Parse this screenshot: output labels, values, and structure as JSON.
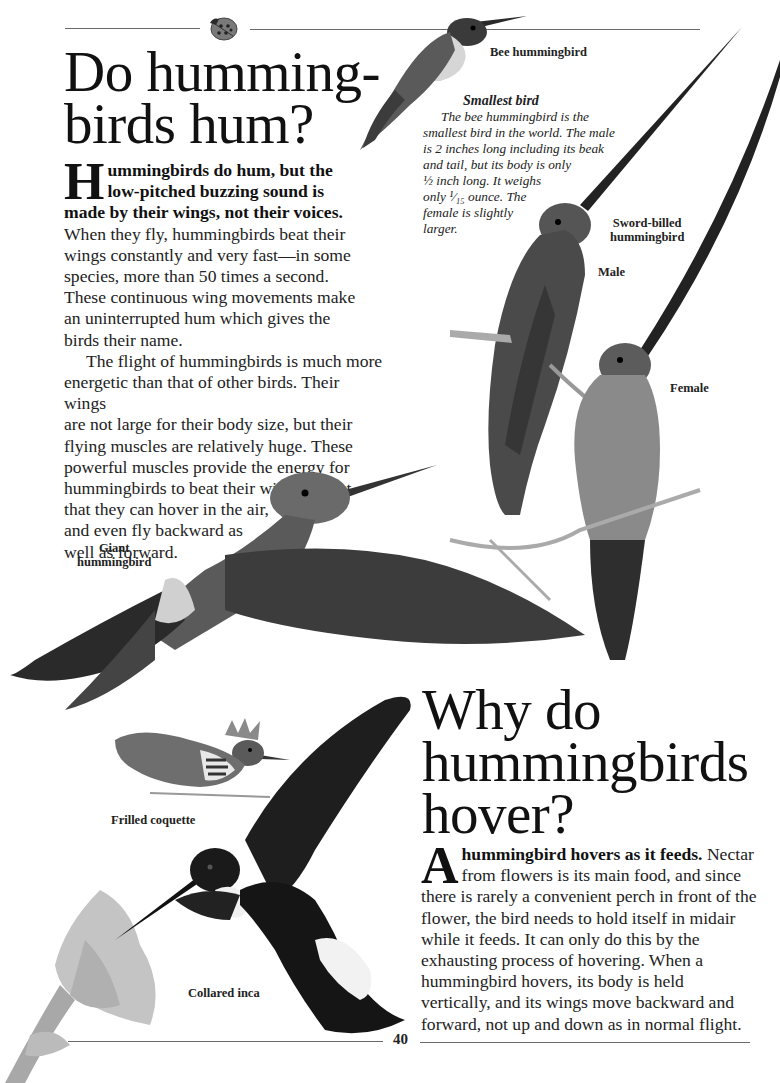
{
  "page": {
    "page_number": "40",
    "colors": {
      "text": "#1a1a1a",
      "rule": "#6a6a6a",
      "background": "#ffffff"
    }
  },
  "section1": {
    "title_lines": [
      "Do humming-",
      "birds hum?"
    ],
    "dropcap": "H",
    "lead_bold": "ummingbirds do hum, but the low-pitched buzzing sound is made by their wings, not their voices.",
    "lead_rest": " When they fly, hummingbirds beat their wings constantly and very fast—in some species, more than 50 times a second. These continuous wing movements make an uninterrupted hum which gives the birds their name.",
    "paragraph2_lines": [
      "The flight of hummingbirds is much more",
      "energetic than that of other birds. Their wings",
      "are not large for their body size, but their",
      "flying muscles are relatively huge. These",
      "powerful muscles provide the energy for",
      "hummingbirds to beat their wings so fast",
      "that they can hover in the air,",
      "and even fly backward as",
      "well as forward."
    ]
  },
  "caption": {
    "title": "Smallest bird",
    "lines": [
      "The bee hummingbird is the",
      "smallest bird in the world. The male",
      "is 2 inches long including its beak",
      "and tail, but its body is only",
      "½ inch long. It weighs",
      "only ¹⁄₁₅ ounce. The",
      "female is slightly",
      "larger."
    ]
  },
  "labels": {
    "bee": "Bee hummingbird",
    "sword_billed": [
      "Sword-billed",
      "hummingbird"
    ],
    "male": "Male",
    "female": "Female",
    "giant": [
      "Giant",
      "hummingbird"
    ],
    "frilled": "Frilled coquette",
    "collared": "Collared inca"
  },
  "section2": {
    "title_lines": [
      "Why do",
      "hummingbirds",
      "hover?"
    ],
    "dropcap": "A",
    "lead_bold": " hummingbird hovers as it feeds.",
    "lead_rest": " Nectar from flowers is its main food, and since there is rarely a convenient perch in front of the flower, the bird needs to hold itself in midair while it feeds. It can only do this by the exhausting process of hovering. When a hummingbird hovers, its body is held vertically, and its wings move backward and forward, not up and down as in normal flight."
  },
  "illustrations": [
    {
      "name": "ladybug",
      "icon": "ladybug-icon"
    },
    {
      "name": "bee-hummingbird"
    },
    {
      "name": "sword-billed-male"
    },
    {
      "name": "sword-billed-female"
    },
    {
      "name": "giant-hummingbird"
    },
    {
      "name": "frilled-coquette"
    },
    {
      "name": "collared-inca"
    },
    {
      "name": "flower"
    }
  ]
}
